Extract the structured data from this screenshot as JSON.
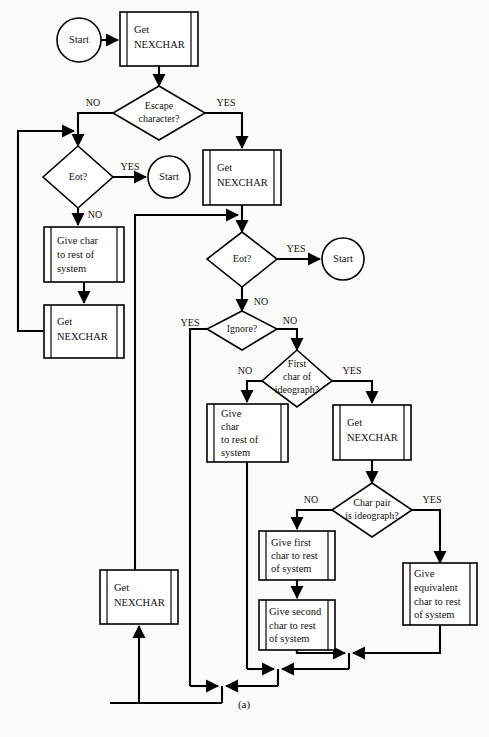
{
  "figure": {
    "caption": "(a)",
    "width": 489,
    "height": 737,
    "background_color": "#fbfbfa",
    "line_color": "#000000",
    "shape_fill": "#ffffff"
  },
  "nodes": {
    "start_1": {
      "type": "terminator",
      "label": "Start"
    },
    "start_2": {
      "type": "terminator",
      "label": "Start"
    },
    "start_3": {
      "type": "terminator",
      "label": "Start"
    },
    "get_nexchar_1": {
      "type": "predefined-process",
      "line1": "Get",
      "line2": "NEXCHAR"
    },
    "escape_character": {
      "type": "decision",
      "line1": "Escape",
      "line2": "character?"
    },
    "eot_1": {
      "type": "decision",
      "line1": "Eot?"
    },
    "give_char_1": {
      "type": "predefined-process",
      "line1": "Give char",
      "line2": "to rest of",
      "line3": "system"
    },
    "get_nexchar_2": {
      "type": "predefined-process",
      "line1": "Get",
      "line2": "NEXCHAR"
    },
    "get_nexchar_3": {
      "type": "predefined-process",
      "line1": "Get",
      "line2": "NEXCHAR"
    },
    "eot_2": {
      "type": "decision",
      "line1": "Eot?"
    },
    "ignore": {
      "type": "decision",
      "line1": "Ignore?"
    },
    "first_char_of_ideograph": {
      "type": "decision",
      "line1": "First",
      "line2": "char of",
      "line3": "ideograph?"
    },
    "give_char_2": {
      "type": "predefined-process",
      "line1": "Give",
      "line2": "char",
      "line3": "to rest of",
      "line4": "system"
    },
    "get_nexchar_4": {
      "type": "predefined-process",
      "line1": "Get",
      "line2": "NEXCHAR"
    },
    "char_pair_is_ideograph": {
      "type": "decision",
      "line1": "Char pair",
      "line2": "is ideograph?"
    },
    "give_first_char": {
      "type": "predefined-process",
      "line1": "Give first",
      "line2": "char to rest",
      "line3": "of system"
    },
    "give_second_char": {
      "type": "predefined-process",
      "line1": "Give second",
      "line2": "char to rest",
      "line3": "of system"
    },
    "give_equivalent_char": {
      "type": "predefined-process",
      "line1": "Give",
      "line2": "equivalent",
      "line3": "char to rest",
      "line4": "of system"
    },
    "get_nexchar_5": {
      "type": "predefined-process",
      "line1": "Get",
      "line2": "NEXCHAR"
    }
  },
  "edge_labels": {
    "escape_no": "NO",
    "escape_yes": "YES",
    "eot1_yes": "YES",
    "eot1_no": "NO",
    "eot2_yes": "YES",
    "eot2_no": "NO",
    "ignore_yes": "YES",
    "ignore_no": "NO",
    "first_char_no": "NO",
    "first_char_yes": "YES",
    "char_pair_no": "NO",
    "char_pair_yes": "YES"
  }
}
